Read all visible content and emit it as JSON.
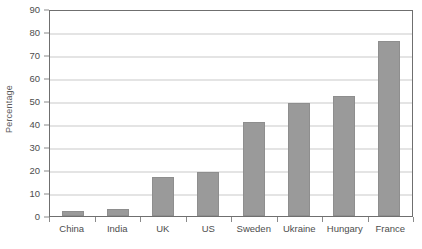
{
  "chart_data": {
    "type": "bar",
    "title": "",
    "xlabel": "",
    "ylabel": "Percentage",
    "categories": [
      "China",
      "India",
      "UK",
      "US",
      "Sweden",
      "Ukraine",
      "Hungary",
      "France"
    ],
    "values": [
      2,
      3,
      17,
      19,
      41,
      49,
      52,
      76
    ],
    "ylim": [
      0,
      90
    ],
    "ytick_values": [
      0,
      10,
      20,
      30,
      40,
      50,
      60,
      70,
      80,
      90
    ],
    "ytick_labels": [
      "0",
      "10",
      "20",
      "30",
      "40",
      "50",
      "60",
      "70",
      "80",
      "90"
    ],
    "grid": true,
    "grid_axis": "y",
    "legend": false,
    "legend_position": "none",
    "bar_color": "#9a9a9a",
    "grid_color": "#c9c9c9",
    "axis_color": "#6f6f6f",
    "background_color": "#ffffff"
  }
}
